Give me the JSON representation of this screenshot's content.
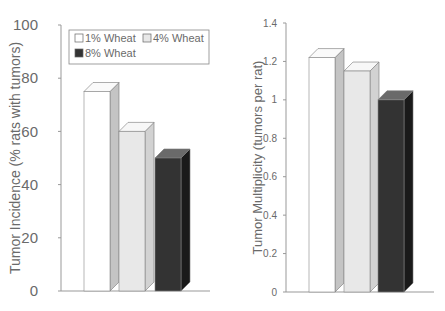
{
  "chart_data": [
    {
      "type": "bar",
      "title": "",
      "xlabel": "",
      "ylabel": "Tumor Incidence (% rats with tumors)",
      "ylim": [
        0,
        100
      ],
      "yticks": [
        "0",
        "20",
        "40",
        "60",
        "80",
        "100"
      ],
      "categories": [
        "1% Wheat",
        "4% Wheat",
        "8% Wheat"
      ],
      "values": [
        75,
        60,
        50
      ],
      "legend": {
        "position": "top-inside",
        "entries": [
          "1% Wheat",
          "4% Wheat",
          "8% Wheat"
        ]
      },
      "grid": false,
      "style": "3d"
    },
    {
      "type": "bar",
      "title": "",
      "xlabel": "",
      "ylabel": "Tumor Multiplicity (tumors per rat)",
      "ylim": [
        0,
        1.4
      ],
      "yticks": [
        "0",
        "0.2",
        "0.4",
        "0.6",
        "0.8",
        "1",
        "1.2",
        "1.4"
      ],
      "categories": [
        "1% Wheat",
        "4% Wheat",
        "8% Wheat"
      ],
      "values": [
        1.22,
        1.15,
        1.0
      ],
      "grid": false,
      "style": "3d"
    }
  ],
  "colors": {
    "bar_1": "#ffffff",
    "bar_2": "#e8e8e8",
    "bar_3": "#333333",
    "axis": "#999999"
  }
}
